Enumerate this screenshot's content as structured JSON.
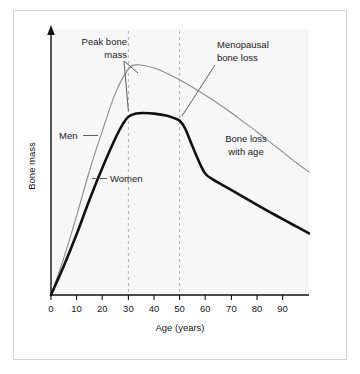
{
  "figure": {
    "background": "#ffffff",
    "plot_background": "#f7f7f7",
    "frame_color": "#d2d2d2"
  },
  "chart_data": {
    "type": "line",
    "title": "",
    "xlabel": "Age (years)",
    "ylabel": "Bone mass",
    "xlim": [
      0,
      100
    ],
    "ylim": [
      0,
      100
    ],
    "grid": false,
    "legend": "none",
    "xticks": [
      0,
      10,
      20,
      30,
      40,
      50,
      60,
      70,
      80,
      90
    ],
    "xtick_labels": [
      "0",
      "10",
      "20",
      "30",
      "40",
      "50",
      "60",
      "70",
      "80",
      "90"
    ],
    "yticks": [],
    "ytick_labels": [],
    "series": [
      {
        "name": "Men",
        "color": "#8c8c8c",
        "width": 1.1,
        "x": [
          0,
          5,
          10,
          15,
          20,
          25,
          30,
          33,
          36,
          40,
          45,
          50,
          55,
          60,
          65,
          70,
          75,
          80,
          85,
          90,
          95,
          100
        ],
        "values": [
          0,
          14,
          30,
          47,
          62,
          76,
          85,
          86.5,
          86.3,
          85.3,
          83.3,
          80.8,
          78,
          75,
          71.8,
          68.4,
          64.8,
          61.2,
          57.4,
          53.6,
          49.8,
          46.2
        ]
      },
      {
        "name": "Women",
        "color": "#111111",
        "width": 2.6,
        "x": [
          0,
          5,
          10,
          15,
          20,
          25,
          28,
          30,
          33,
          36,
          40,
          45,
          48,
          50,
          52,
          55,
          58,
          60,
          63,
          66,
          70,
          75,
          80,
          85,
          90,
          95,
          100
        ],
        "values": [
          0,
          11,
          23,
          36,
          48,
          59,
          64.5,
          67,
          68.2,
          68.4,
          68.2,
          67.4,
          66.4,
          65.4,
          62.6,
          55.5,
          48.8,
          45.4,
          43.3,
          41.6,
          39.4,
          36.6,
          33.8,
          31.1,
          28.4,
          25.8,
          23.2
        ]
      }
    ],
    "vlines": [
      {
        "name": "age-30-marker",
        "x": 30,
        "style": "dashed",
        "color": "#b0b0b0"
      },
      {
        "name": "age-50-marker",
        "x": 50,
        "style": "dashed",
        "color": "#b0b0b0"
      }
    ],
    "annotations": [
      {
        "name": "peak-bone-mass",
        "lines": [
          "Peak bone",
          "mass"
        ],
        "leader": true
      },
      {
        "name": "menopausal-bone-loss",
        "lines": [
          "Menopausal",
          "bone loss"
        ],
        "leader": true
      },
      {
        "name": "bone-loss-with-age",
        "lines": [
          "Bone loss",
          "with age"
        ],
        "leader": false
      },
      {
        "name": "men-label",
        "lines": [
          "Men"
        ],
        "leader": true
      },
      {
        "name": "women-label",
        "lines": [
          "Women"
        ],
        "leader": true
      }
    ]
  }
}
